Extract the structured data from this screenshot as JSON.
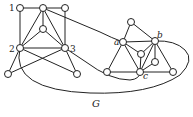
{
  "diagram": {
    "title": "G",
    "labels": {
      "n1": "1",
      "n2": "2",
      "n3": "3",
      "a": "a",
      "b": "b",
      "c": "c"
    },
    "colors": {
      "stroke": "#222222",
      "node_fill": "#ffffff",
      "background": "#ffffff"
    },
    "nodes": [
      {
        "id": "n1",
        "x": 20,
        "y": 8,
        "label": "1"
      },
      {
        "id": "t",
        "x": 43,
        "y": 8
      },
      {
        "id": "tr",
        "x": 65,
        "y": 8
      },
      {
        "id": "m",
        "x": 43,
        "y": 29
      },
      {
        "id": "n2",
        "x": 20,
        "y": 48,
        "label": "2"
      },
      {
        "id": "n3",
        "x": 65,
        "y": 48,
        "label": "3"
      },
      {
        "id": "bl",
        "x": 8,
        "y": 74
      },
      {
        "id": "br",
        "x": 77,
        "y": 74
      },
      {
        "id": "rt",
        "x": 131,
        "y": 22
      },
      {
        "id": "a",
        "x": 123,
        "y": 42,
        "label": "a"
      },
      {
        "id": "b",
        "x": 155,
        "y": 41,
        "label": "b"
      },
      {
        "id": "ri",
        "x": 141,
        "y": 54
      },
      {
        "id": "ri2",
        "x": 155,
        "y": 62
      },
      {
        "id": "c",
        "x": 140,
        "y": 72,
        "label": "c"
      },
      {
        "id": "rl",
        "x": 107,
        "y": 72
      },
      {
        "id": "rr",
        "x": 173,
        "y": 72
      }
    ]
  }
}
